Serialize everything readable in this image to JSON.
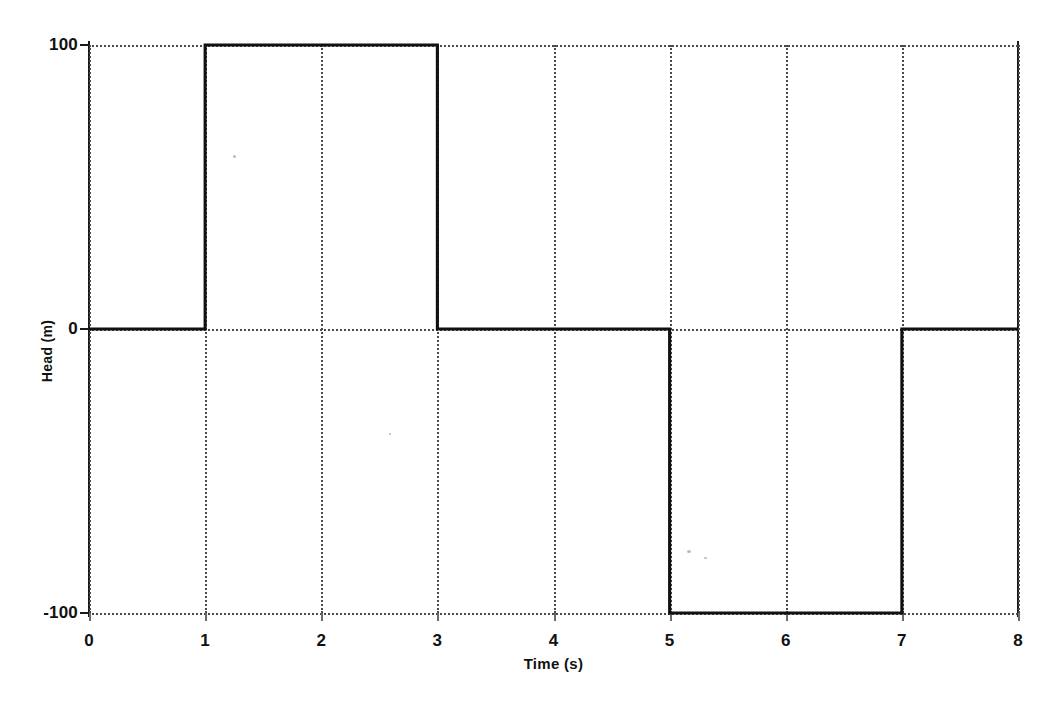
{
  "chart_data": {
    "type": "line",
    "title": "",
    "xlabel": "Time (s)",
    "ylabel": "Head (m)",
    "xlim": [
      0,
      8
    ],
    "ylim": [
      -100,
      100
    ],
    "xticks": [
      0,
      1,
      2,
      3,
      4,
      5,
      6,
      7,
      8
    ],
    "xtick_labels": [
      "0",
      "1",
      "2",
      "3",
      "4",
      "5",
      "6",
      "7",
      "8"
    ],
    "yticks": [
      -100,
      0,
      100
    ],
    "ytick_labels": [
      "100",
      "0",
      "-100"
    ],
    "grid": true,
    "grid_style": "dotted",
    "legend": "none",
    "series": [
      {
        "name": "Head",
        "line_color": "#111111",
        "x": [
          0,
          1,
          1,
          3,
          3,
          5,
          5,
          7,
          7,
          8
        ],
        "y": [
          0,
          0,
          100,
          100,
          0,
          0,
          -100,
          -100,
          0,
          0
        ]
      }
    ]
  },
  "axes": {
    "x_title": "Time (s)",
    "y_title": "Head (m)"
  }
}
